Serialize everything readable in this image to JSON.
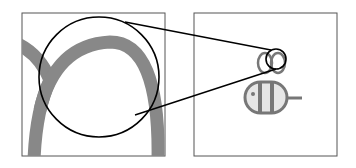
{
  "diagram": {
    "type": "magnifier-inset",
    "panels": [
      {
        "id": "zoomed-view",
        "content": "magnified wing outline detail"
      },
      {
        "id": "full-view",
        "content": "bee icon"
      }
    ],
    "colors": {
      "frame": "#555555",
      "icon_stroke": "#777777",
      "icon_fill": "#e6e6e6",
      "lens": "#000000"
    }
  }
}
